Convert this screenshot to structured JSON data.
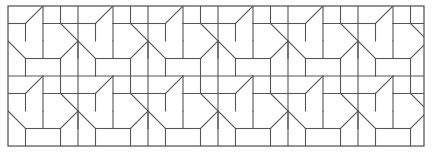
{
  "figure": {
    "width": 432,
    "height": 157
  },
  "canvas": {
    "background_color": "#ffffff"
  },
  "frame": {
    "name": "outer-border",
    "x": 8,
    "y": 6,
    "width": 416,
    "height": 140,
    "stroke_color": "#4d4d4d",
    "stroke_width": 1.2,
    "fill": "none"
  },
  "pattern": {
    "stroke_color": "#555555",
    "diagonal_stroke_color": "#222222",
    "stroke_width": 1.1,
    "tile_size": 70,
    "half_tile": 35,
    "quarter_tile": 17.5,
    "columns": 6,
    "rows": 2,
    "origin_x": 8,
    "origin_y": 6,
    "repeat_label": "70 x 70 unit cell",
    "motif_quadrants": [
      {
        "name": "quadrant-top-left",
        "segments": "horizontal mid-left, vertical center-down, diagonal center to top-right"
      },
      {
        "name": "quadrant-top-right",
        "segments": "horizontal mid, vertical left, diagonal to bottom-right"
      },
      {
        "name": "quadrant-bottom-left",
        "segments": "diagonal from top-left down-right, horizontal mid, vertical stub"
      },
      {
        "name": "quadrant-bottom-right",
        "segments": "horizontal mid, vertical center, diagonal up-right"
      }
    ]
  },
  "grid": {
    "vertical_line_spacing": 17.5,
    "horizontal_line_spacing": 17.5,
    "major_row_divider_y": [
      6,
      76,
      146
    ],
    "major_col_divider_x": [
      8,
      78,
      148,
      218,
      288,
      358,
      424
    ]
  }
}
